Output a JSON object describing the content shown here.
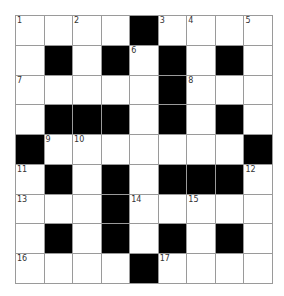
{
  "puzzle": {
    "rows": 9,
    "cols": 9,
    "colors": {
      "black": "#000000",
      "white": "#ffffff",
      "gridline": "#9a9a9a"
    },
    "layout": [
      "....#....",
      ".#.#.#.#.",
      ".....#...",
      ".###.#.#.",
      "#.......#",
      ".#.#.###.",
      "...#.....",
      ".#.#.#.#.",
      "....#...."
    ],
    "numbers": [
      {
        "row": 0,
        "col": 0,
        "n": "1"
      },
      {
        "row": 0,
        "col": 2,
        "n": "2"
      },
      {
        "row": 0,
        "col": 5,
        "n": "3"
      },
      {
        "row": 0,
        "col": 6,
        "n": "4"
      },
      {
        "row": 0,
        "col": 8,
        "n": "5"
      },
      {
        "row": 1,
        "col": 4,
        "n": "6"
      },
      {
        "row": 2,
        "col": 0,
        "n": "7"
      },
      {
        "row": 2,
        "col": 6,
        "n": "8"
      },
      {
        "row": 4,
        "col": 1,
        "n": "9"
      },
      {
        "row": 4,
        "col": 2,
        "n": "10"
      },
      {
        "row": 5,
        "col": 0,
        "n": "11"
      },
      {
        "row": 5,
        "col": 8,
        "n": "12"
      },
      {
        "row": 6,
        "col": 0,
        "n": "13"
      },
      {
        "row": 6,
        "col": 4,
        "n": "14"
      },
      {
        "row": 6,
        "col": 6,
        "n": "15"
      },
      {
        "row": 8,
        "col": 0,
        "n": "16"
      },
      {
        "row": 8,
        "col": 5,
        "n": "17"
      }
    ]
  }
}
